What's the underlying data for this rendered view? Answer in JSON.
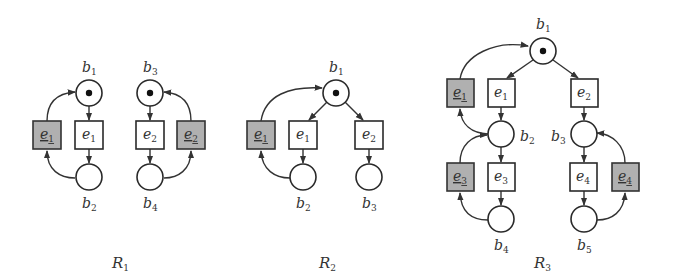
{
  "colors": {
    "stroke": "#2a2a2a",
    "reverse_fill": "#b0b0b0",
    "normal_fill": "#ffffff",
    "token": "#111111",
    "text": "#333333"
  },
  "nets": [
    {
      "id": "R1",
      "title": "R",
      "title_sub": "1",
      "places": [
        {
          "id": "b1",
          "label": "b",
          "sub": "1",
          "token": true
        },
        {
          "id": "b2",
          "label": "b",
          "sub": "2",
          "token": false
        },
        {
          "id": "b3",
          "label": "b",
          "sub": "3",
          "token": true
        },
        {
          "id": "b4",
          "label": "b",
          "sub": "4",
          "token": false
        }
      ],
      "transitions": [
        {
          "id": "e1",
          "label": "e",
          "sub": "1",
          "reverse": false
        },
        {
          "id": "e1_rev",
          "label": "e",
          "sub": "1",
          "reverse": true
        },
        {
          "id": "e2",
          "label": "e",
          "sub": "2",
          "reverse": false
        },
        {
          "id": "e2_rev",
          "label": "e",
          "sub": "2",
          "reverse": true
        }
      ]
    },
    {
      "id": "R2",
      "title": "R",
      "title_sub": "2",
      "places": [
        {
          "id": "b1",
          "label": "b",
          "sub": "1",
          "token": true
        },
        {
          "id": "b2",
          "label": "b",
          "sub": "2",
          "token": false
        },
        {
          "id": "b3",
          "label": "b",
          "sub": "3",
          "token": false
        }
      ],
      "transitions": [
        {
          "id": "e1",
          "label": "e",
          "sub": "1",
          "reverse": false
        },
        {
          "id": "e1_rev",
          "label": "e",
          "sub": "1",
          "reverse": true
        },
        {
          "id": "e2",
          "label": "e",
          "sub": "2",
          "reverse": false
        }
      ]
    },
    {
      "id": "R3",
      "title": "R",
      "title_sub": "3",
      "places": [
        {
          "id": "b1",
          "label": "b",
          "sub": "1",
          "token": true
        },
        {
          "id": "b2",
          "label": "b",
          "sub": "2",
          "token": false
        },
        {
          "id": "b3",
          "label": "b",
          "sub": "3",
          "token": false
        },
        {
          "id": "b4",
          "label": "b",
          "sub": "4",
          "token": false
        },
        {
          "id": "b5",
          "label": "b",
          "sub": "5",
          "token": false
        }
      ],
      "transitions": [
        {
          "id": "e1",
          "label": "e",
          "sub": "1",
          "reverse": false
        },
        {
          "id": "e1_rev",
          "label": "e",
          "sub": "1",
          "reverse": true
        },
        {
          "id": "e2",
          "label": "e",
          "sub": "2",
          "reverse": false
        },
        {
          "id": "e3",
          "label": "e",
          "sub": "3",
          "reverse": false
        },
        {
          "id": "e3_rev",
          "label": "e",
          "sub": "3",
          "reverse": true
        },
        {
          "id": "e4",
          "label": "e",
          "sub": "4",
          "reverse": false
        },
        {
          "id": "e4_rev",
          "label": "e",
          "sub": "4",
          "reverse": true
        }
      ]
    }
  ]
}
